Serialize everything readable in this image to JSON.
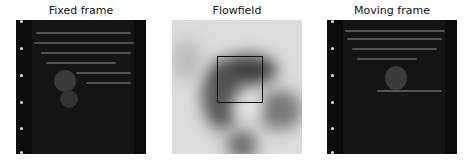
{
  "panels": [
    {
      "title": "Fixed frame",
      "type": "ultrasound"
    },
    {
      "title": "Flowfield",
      "type": "flowfield",
      "highlight_box": true
    },
    {
      "title": "Moving frame",
      "type": "ultrasound"
    }
  ],
  "colors": {
    "background": "#ffffff",
    "ultrasound_bg": "#141414",
    "box": "#111111"
  }
}
